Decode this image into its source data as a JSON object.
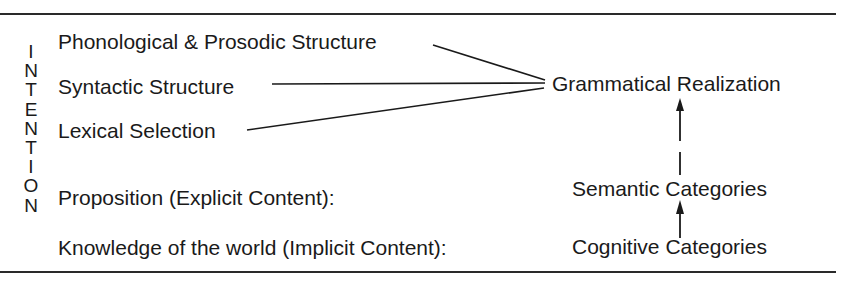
{
  "diagram": {
    "vertical_label": "INTENTION",
    "vertical_letters": [
      "I",
      "N",
      "T",
      "E",
      "N",
      "T",
      "I",
      "O",
      "N"
    ],
    "left_items": [
      {
        "id": "phonological",
        "label": "Phonological & Prosodic Structure"
      },
      {
        "id": "syntactic",
        "label": "Syntactic Structure"
      },
      {
        "id": "lexical",
        "label": "Lexical Selection"
      },
      {
        "id": "proposition",
        "label": "Proposition (Explicit Content):"
      },
      {
        "id": "knowledge",
        "label": "Knowledge of the world (Implicit Content):"
      }
    ],
    "right_items": [
      {
        "id": "grammatical",
        "label": "Grammatical Realization"
      },
      {
        "id": "semantic",
        "label": "Semantic Categories"
      },
      {
        "id": "cognitive",
        "label": "Cognitive Categories"
      }
    ],
    "edges": [
      {
        "from": "phonological",
        "to": "grammatical",
        "type": "line"
      },
      {
        "from": "syntactic",
        "to": "grammatical",
        "type": "line"
      },
      {
        "from": "lexical",
        "to": "grammatical",
        "type": "line"
      },
      {
        "from": "semantic",
        "to": "grammatical",
        "type": "arrow"
      },
      {
        "from": "cognitive",
        "to": "semantic",
        "type": "arrow"
      }
    ],
    "colors": {
      "ink": "#1a1a1a",
      "background": "#ffffff"
    }
  }
}
